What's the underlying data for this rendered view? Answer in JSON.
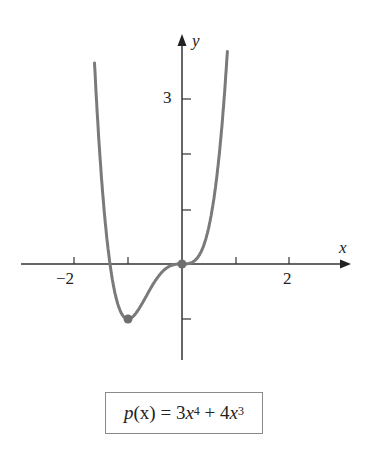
{
  "chart_data": {
    "type": "line",
    "title": "",
    "function": "p(x) = 3x^4 + 4x^3",
    "xlabel": "x",
    "ylabel": "y",
    "xlim": [
      -3,
      3
    ],
    "ylim": [
      -1.8,
      4
    ],
    "x_tick_labels": [
      "-2",
      "2"
    ],
    "x_ticks": [
      -2,
      -1,
      1,
      2
    ],
    "y_tick_labels": [
      "3"
    ],
    "y_ticks": [
      -1,
      1,
      2,
      3
    ],
    "marked_points": [
      {
        "x": -1,
        "y": -1,
        "label": "local minimum"
      },
      {
        "x": 0,
        "y": 0,
        "label": "inflection / critical point"
      }
    ],
    "series": [
      {
        "name": "p(x)",
        "color": "#7a7a7a"
      }
    ],
    "grid": false,
    "legend": "none"
  },
  "axes": {
    "x_label": "x",
    "y_label": "y",
    "x_tick_neg2": "−2",
    "x_tick_2": "2",
    "y_tick_3": "3"
  },
  "formula": {
    "lhs_fn": "p",
    "lhs_arg": "(x) = 3",
    "var1": "x",
    "exp1": "4",
    "mid": " + 4",
    "var2": "x",
    "exp2": "3"
  },
  "colors": {
    "curve": "#7a7a7a",
    "axis": "#333333",
    "box_border": "#8a8a8a"
  }
}
